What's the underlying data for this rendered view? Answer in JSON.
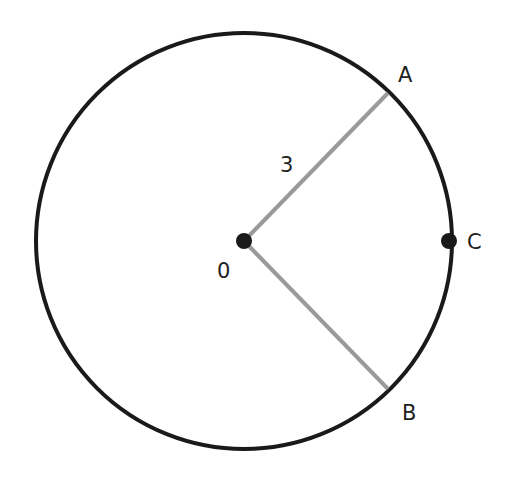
{
  "diagram": {
    "type": "circle-with-radii",
    "circle": {
      "cx": 244,
      "cy": 241,
      "r": 208,
      "stroke": "#1a1a1a",
      "stroke_width": 4
    },
    "center_point": {
      "x": 244,
      "y": 241,
      "label": "0"
    },
    "radius_label": "3",
    "points": {
      "A": {
        "x": 388,
        "y": 93,
        "label": "A"
      },
      "B": {
        "x": 388,
        "y": 389,
        "label": "B"
      },
      "C": {
        "x": 449,
        "y": 241,
        "label": "C"
      }
    },
    "colors": {
      "circle": "#1a1a1a",
      "radius_lines": "#9a9a9a",
      "points": "#1a1a1a"
    }
  }
}
